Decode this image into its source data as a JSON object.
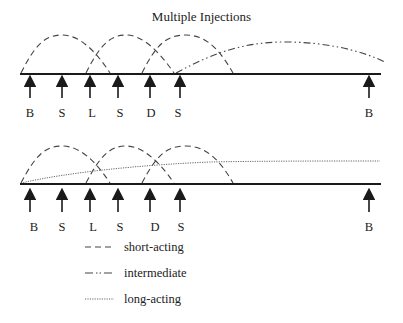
{
  "title": "Multiple Injections",
  "colors": {
    "line": "#1a1a1a",
    "curve": "#444444",
    "text": "#222222",
    "background": "#ffffff"
  },
  "panels": [
    {
      "name": "top-panel",
      "injections": [
        {
          "label": "B",
          "x": 30
        },
        {
          "label": "S",
          "x": 62
        },
        {
          "label": "L",
          "x": 90
        },
        {
          "label": "S",
          "x": 118
        },
        {
          "label": "D",
          "x": 150
        },
        {
          "label": "S",
          "x": 180
        },
        {
          "label": "B",
          "x": 369
        }
      ],
      "curves": [
        "short-acting",
        "short-acting",
        "short-acting",
        "intermediate"
      ]
    },
    {
      "name": "bottom-panel",
      "injections": [
        {
          "label": "B",
          "x": 30
        },
        {
          "label": "S",
          "x": 62
        },
        {
          "label": "L",
          "x": 90
        },
        {
          "label": "S",
          "x": 118
        },
        {
          "label": "D",
          "x": 150
        },
        {
          "label": "S",
          "x": 180
        },
        {
          "label": "B",
          "x": 369
        }
      ],
      "curves": [
        "short-acting",
        "short-acting",
        "short-acting",
        "long-acting"
      ]
    }
  ],
  "legend": [
    {
      "style": "dashed",
      "label": "short-acting"
    },
    {
      "style": "dash-dot",
      "label": "intermediate"
    },
    {
      "style": "dotted",
      "label": "long-acting"
    }
  ]
}
